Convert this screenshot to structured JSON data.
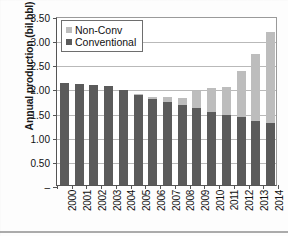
{
  "chart_data": {
    "type": "bar",
    "stacked": true,
    "title": "",
    "xlabel": "",
    "ylabel": "Annual production (bil.bbl)",
    "ylim": [
      0,
      3.5
    ],
    "ytick_values": [
      0,
      0.5,
      1.0,
      1.5,
      2.0,
      2.5,
      3.0,
      3.5
    ],
    "ytick_labels": [
      "–",
      "0.50",
      "1.00",
      "1.50",
      "2.00",
      "2.50",
      "3.00",
      "3.50"
    ],
    "grid": "horizontal",
    "legend_position": "top-left",
    "categories": [
      "2000",
      "2001",
      "2002",
      "2003",
      "2004",
      "2005",
      "2006",
      "2007",
      "2008",
      "2009",
      "2010",
      "2011",
      "2012",
      "2013",
      "2014"
    ],
    "series": [
      {
        "name": "Conventional",
        "color": "#5b5b5b",
        "values": [
          2.11,
          2.1,
          2.08,
          2.06,
          1.97,
          1.87,
          1.79,
          1.72,
          1.66,
          1.59,
          1.52,
          1.46,
          1.4,
          1.33,
          1.28
        ]
      },
      {
        "name": "Non-Conv",
        "color": "#bdbdbd",
        "values": [
          0.0,
          0.0,
          0.0,
          0.0,
          0.0,
          0.01,
          0.03,
          0.1,
          0.15,
          0.35,
          0.48,
          0.58,
          0.97,
          1.39,
          1.89
        ]
      }
    ],
    "totals": [
      2.11,
      2.1,
      2.08,
      2.06,
      1.97,
      1.88,
      1.82,
      1.82,
      1.81,
      1.94,
      2.0,
      2.04,
      2.37,
      2.72,
      3.17
    ]
  },
  "legend": {
    "items": [
      {
        "label": "Non-Conv",
        "color": "#bdbdbd"
      },
      {
        "label": "Conventional",
        "color": "#5b5b5b"
      }
    ]
  }
}
